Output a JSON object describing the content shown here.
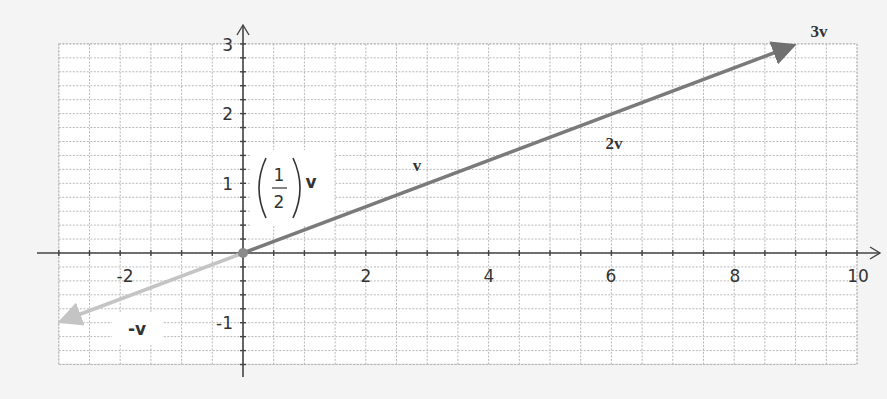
{
  "diagram": {
    "type": "vector-scalar-multiples",
    "background": "#f4f4f4",
    "grid_color": "#b8b8b8",
    "axis_color": "#444444",
    "x_axis": {
      "min": -3,
      "max": 10,
      "tick_labels": [
        "-2",
        "2",
        "4",
        "6",
        "8",
        "10"
      ],
      "tick_values": [
        -2,
        2,
        4,
        6,
        8,
        10
      ],
      "grid_step": 0.5
    },
    "y_axis": {
      "min": -1.6,
      "max": 3,
      "tick_labels": [
        "3",
        "2",
        "1",
        "-1"
      ],
      "tick_values": [
        3,
        2,
        1,
        -1
      ],
      "grid_step": 0.2
    },
    "base_vector": {
      "name": "v",
      "x": 3,
      "y": 1
    },
    "vectors": [
      {
        "id": "neg-v",
        "label": "-v",
        "scalar": -1,
        "end": [
          -3,
          -1
        ],
        "color": "#c8c8c8"
      },
      {
        "id": "half-v",
        "label_frac_num": "1",
        "label_frac_den": "2",
        "label_suffix": "v",
        "scalar": 0.5,
        "end": [
          1.5,
          0.5
        ],
        "color": "#7a7a7a"
      },
      {
        "id": "v",
        "label": "v",
        "scalar": 1,
        "end": [
          3,
          1
        ],
        "color": "#7a7a7a"
      },
      {
        "id": "two-v",
        "label": "2v",
        "scalar": 2,
        "end": [
          6,
          2
        ],
        "color": "#7a7a7a"
      },
      {
        "id": "three-v",
        "label": "3v",
        "scalar": 3,
        "end": [
          9,
          3
        ],
        "color": "#7a7a7a"
      }
    ]
  }
}
